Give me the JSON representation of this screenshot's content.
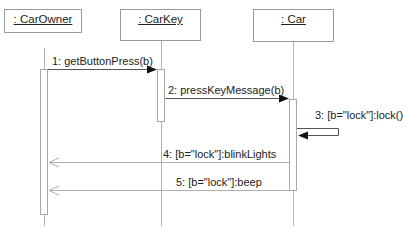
{
  "diagram": {
    "type": "UML sequence diagram",
    "objects": [
      {
        "id": "carowner",
        "label": ": CarOwner"
      },
      {
        "id": "carkey",
        "label": ": CarKey"
      },
      {
        "id": "car",
        "label": ": Car"
      }
    ],
    "messages": [
      {
        "label": "1: getButtonPress(b)",
        "from": "carowner",
        "to": "carkey",
        "kind": "synchronous"
      },
      {
        "label": "2: pressKeyMessage(b)",
        "from": "carkey",
        "to": "car",
        "kind": "synchronous"
      },
      {
        "label": "3: [b=\"lock\"]:lock()",
        "from": "car",
        "to": "car",
        "kind": "self"
      },
      {
        "label": "4: [b=\"lock\"]:blinkLights",
        "from": "car",
        "to": "carowner",
        "kind": "asynchronous"
      },
      {
        "label": "5: [b=\"lock\"]:beep",
        "from": "car",
        "to": "carowner",
        "kind": "asynchronous"
      }
    ]
  },
  "colors": {
    "box_border": "#9a9a9a",
    "lifeline": "#b4b4b4",
    "arrow_solid": "#222222",
    "arrow_return": "#b0b0b0"
  }
}
